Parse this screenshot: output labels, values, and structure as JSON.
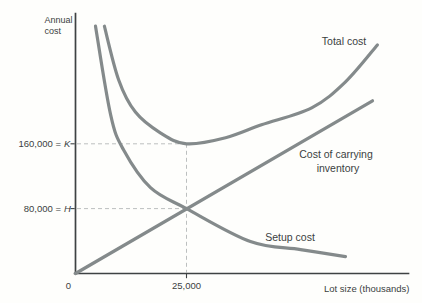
{
  "figure": {
    "y_axis_title": {
      "line1": "Annual",
      "line2": "cost"
    },
    "x_axis_title": "Lot size (thousands)",
    "origin": "0",
    "x_tick": "25,000",
    "y_tick_k": {
      "text": "160,000 =",
      "symbol": "K"
    },
    "y_tick_h": {
      "text": "80,000 =",
      "symbol": "H"
    }
  },
  "labels": {
    "total_cost": "Total cost",
    "carrying_line1": "Cost of carrying",
    "carrying_line2": "inventory",
    "setup_cost": "Setup cost"
  },
  "chart_data": {
    "type": "line",
    "title": "",
    "xlabel": "Lot size (thousands)",
    "ylabel": "Annual cost",
    "xlim": [
      0,
      75000
    ],
    "ylim": [
      0,
      320000
    ],
    "grid": false,
    "legend": "inline-labels",
    "x_ticks": [
      {
        "value": 25000,
        "label": "25,000"
      }
    ],
    "y_ticks": [
      {
        "value": 160000,
        "label": "160,000 = K"
      },
      {
        "value": 80000,
        "label": "80,000 = H"
      }
    ],
    "series": [
      {
        "name": "Total cost",
        "points": [
          [
            6500,
            305000
          ],
          [
            9700,
            239000
          ],
          [
            13500,
            199000
          ],
          [
            19100,
            173500
          ],
          [
            25000,
            160000
          ],
          [
            33800,
            167400
          ],
          [
            41900,
            183400
          ],
          [
            53200,
            204300
          ],
          [
            60800,
            236300
          ],
          [
            68000,
            281800
          ]
        ]
      },
      {
        "name": "Cost of carrying inventory",
        "points": [
          [
            0,
            0
          ],
          [
            66900,
            213000
          ]
        ]
      },
      {
        "name": "Setup cost",
        "points": [
          [
            4500,
            305000
          ],
          [
            7900,
            196000
          ],
          [
            10800,
            152600
          ],
          [
            16900,
            105800
          ],
          [
            25000,
            80000
          ],
          [
            39400,
            39400
          ],
          [
            50700,
            29500
          ],
          [
            60800,
            20900
          ]
        ]
      }
    ],
    "annotations": {
      "k_value": 160000,
      "h_value": 80000,
      "eoq_lot_size": 25000,
      "optimum_total_cost": 160000,
      "optimum_setup_cost": 80000,
      "optimum_carrying_cost": 80000
    },
    "colors": {
      "curve": "#848a8b",
      "axis": "#3e4243",
      "guide": "#bcbfbf",
      "text": "#3b3e3f",
      "background": "#fefefc"
    }
  }
}
